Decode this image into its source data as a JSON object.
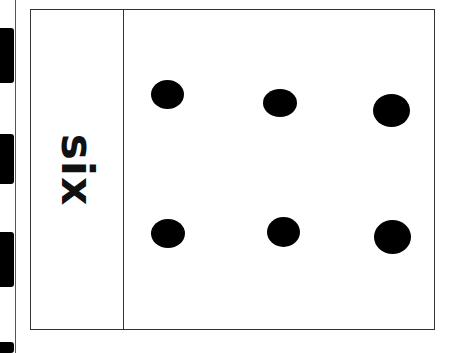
{
  "card": {
    "word": "six",
    "count": 6,
    "dots": [
      {
        "x": 151,
        "y": 80,
        "w": 33,
        "h": 29
      },
      {
        "x": 263,
        "y": 89,
        "w": 34,
        "h": 28
      },
      {
        "x": 373,
        "y": 94,
        "w": 37,
        "h": 33
      },
      {
        "x": 151,
        "y": 219,
        "w": 34,
        "h": 29
      },
      {
        "x": 267,
        "y": 217,
        "w": 33,
        "h": 30
      },
      {
        "x": 374,
        "y": 220,
        "w": 37,
        "h": 34
      }
    ]
  },
  "film_holes": [
    {
      "top": 28,
      "height": 55
    },
    {
      "top": 134,
      "height": 50
    },
    {
      "top": 232,
      "height": 55
    },
    {
      "top": 342,
      "height": 11
    }
  ]
}
